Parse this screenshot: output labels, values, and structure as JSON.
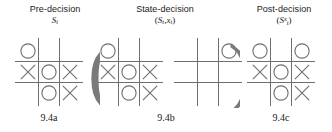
{
  "figure": {
    "panels": [
      {
        "id": "pre-decision",
        "title": "Pre-decision",
        "symbol_main": "S",
        "symbol_sub": "t",
        "symbol_sup": "",
        "caption": "9.4a",
        "boards": [
          {
            "name": "pre-decision-board",
            "cells": [
              "O",
              "",
              "",
              "X",
              "O",
              "X",
              "",
              "O",
              "X"
            ]
          }
        ]
      },
      {
        "id": "state-decision",
        "title": "State-decision",
        "symbol_open": "(",
        "symbol_main": "S",
        "symbol_sub": "t",
        "symbol_comma": ",",
        "symbol_main2": "x",
        "symbol_sub2": "t",
        "symbol_close": ")",
        "caption": "9.4b",
        "boards": [
          {
            "name": "state-board",
            "cells": [
              "O",
              "",
              "",
              "X",
              "O",
              "X",
              "",
              "O",
              "X"
            ]
          },
          {
            "name": "decision-board",
            "cells": [
              "",
              "",
              "O",
              "",
              "",
              "",
              "",
              "",
              ""
            ]
          }
        ]
      },
      {
        "id": "post-decision",
        "title": "Post-decision",
        "symbol_open": "(",
        "symbol_main": "S",
        "symbol_sub": "t",
        "symbol_sup": "x",
        "symbol_close": ")",
        "caption": "9.4c",
        "boards": [
          {
            "name": "post-decision-board",
            "cells": [
              "O",
              "",
              "O",
              "X",
              "O",
              "X",
              "",
              "O",
              "X"
            ]
          }
        ]
      }
    ],
    "paren_left": "(",
    "paren_right": ")",
    "colors": {
      "background": "#ffffff",
      "text": "#1b1b1b",
      "grid_line": "#6e6e6e",
      "mark": "#6e6e6e",
      "paren": "#7a7a7a"
    }
  }
}
